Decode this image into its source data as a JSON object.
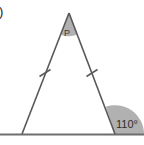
{
  "figure": {
    "type": "geometry-diagram",
    "canvas": {
      "width": 144,
      "height": 145,
      "background_color": "#ffffff"
    },
    "item_number": ")",
    "apex_label": "P",
    "exterior_angle_label": "110°",
    "colors": {
      "stroke": "#58585a",
      "base_line": "#6e6e70",
      "apex_shade": "#a9a9a9",
      "exterior_shade": "#a3a3a3",
      "tick_mark": "#58585a",
      "text": "#2e2e2e"
    },
    "points": {
      "apex": {
        "name": "P",
        "x": 69,
        "y": 13
      },
      "left_base": {
        "name": "left-vertex",
        "x": 22,
        "y": 134
      },
      "right_base": {
        "name": "right-vertex",
        "x": 115,
        "y": 134
      },
      "base_line_start": {
        "x": 0,
        "y": 134
      },
      "base_line_end": {
        "x": 144,
        "y": 134
      }
    },
    "tick_marks": [
      {
        "name": "left-side-tick",
        "x": 45,
        "y": 73
      },
      {
        "name": "right-side-tick",
        "x": 92,
        "y": 73
      }
    ],
    "angles": [
      {
        "name": "apex-angle",
        "label": "P",
        "vertex": "apex",
        "shaded": true
      },
      {
        "name": "exterior-angle",
        "label": "110°",
        "value": 110,
        "vertex": "right_base",
        "shaded": true
      }
    ]
  }
}
